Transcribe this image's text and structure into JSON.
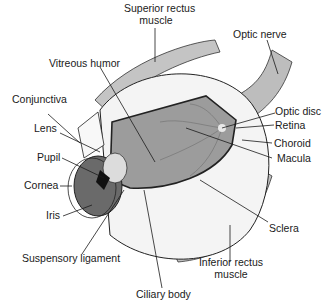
{
  "diagram": {
    "labels": {
      "superior_rectus": [
        "Superior rectus",
        "muscle"
      ],
      "optic_nerve": "Optic nerve",
      "vitreous_humor": "Vitreous humor",
      "conjunctiva": "Conjunctiva",
      "lens": "Lens",
      "pupil": "Pupil",
      "cornea": "Cornea",
      "iris": "Iris",
      "suspensory_ligament": "Suspensory ligament",
      "ciliary_body": "Ciliary body",
      "optic_disc": "Optic disc",
      "retina": "Retina",
      "choroid": "Choroid",
      "macula": "Macula",
      "sclera": "Sclera",
      "inferior_rectus": [
        "Inferior rectus",
        "muscle"
      ]
    },
    "colors": {
      "background": "#ffffff",
      "outline": "#1a1a1a",
      "interior": "#9a9a9a",
      "muscle": "#b8b8b8",
      "sclera": "#f2f2f2",
      "iris": "#5a5a5a"
    }
  }
}
